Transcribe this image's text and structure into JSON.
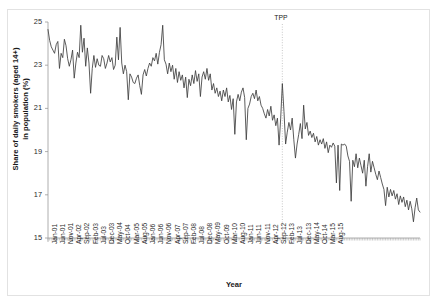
{
  "figure": {
    "caption_remnant": "",
    "x_axis_title": "Year",
    "y_axis_title_line1": "Share of daily smokers (aged 14+)",
    "y_axis_title_line2": "in population (%)",
    "annotation_label": "TPP",
    "line_color": "#3f3f3f",
    "axis_color": "#9a9a9a",
    "annotation_color": "#b0b0b0",
    "frame_color": "#e2e2e2"
  },
  "chart_data": {
    "type": "line",
    "title": "",
    "subtitle": "",
    "xlabel": "Year",
    "ylabel": "Share of daily smokers (aged 14+) in population (%)",
    "ylim": [
      15,
      25
    ],
    "yticks": [
      15,
      17,
      19,
      21,
      23,
      25
    ],
    "grid": false,
    "legend": false,
    "x_tick_labels": [
      "Jan-01",
      "Jun-01",
      "Nov-01",
      "Apr-02",
      "Sep-02",
      "Feb-03",
      "Jul-03",
      "Dec-03",
      "May-04",
      "Oct-04",
      "Mar-05",
      "Aug-05",
      "Jan-06",
      "Jun-06",
      "Nov-06",
      "Apr-07",
      "Sep-07",
      "Feb-08",
      "Jul-08",
      "Dec-08",
      "May-09",
      "Oct-09",
      "Mar-10",
      "Aug-10",
      "Jan-11",
      "Jun-11",
      "Nov-11",
      "Apr-12",
      "Sep-12",
      "Feb-13",
      "Jul-13",
      "Dec-13",
      "May-14",
      "Oct-14",
      "Mar-15",
      "Aug-15"
    ],
    "x_tick_interval_months": 5,
    "x_start": "Jan-01",
    "x_end": "Aug-15",
    "annotations": [
      {
        "label": "TPP",
        "x_index": 143,
        "x_label": "Dec-12",
        "style": "dotted-vertical-line"
      }
    ],
    "series": [
      {
        "name": "Share of daily smokers (aged 14+) in population (%)",
        "values": [
          24.65,
          24.15,
          23.85,
          23.7,
          23.55,
          23.95,
          24.1,
          22.85,
          23.55,
          23.35,
          24.2,
          23.9,
          23.3,
          22.95,
          23.25,
          23.7,
          22.4,
          23.1,
          23.6,
          23.35,
          24.85,
          23.6,
          24.25,
          22.95,
          23.8,
          23.1,
          21.7,
          22.85,
          23.45,
          22.9,
          23.3,
          23.0,
          22.95,
          23.45,
          23.3,
          22.85,
          23.1,
          23.45,
          23.15,
          23.35,
          22.8,
          23.0,
          24.3,
          23.25,
          24.75,
          23.1,
          22.6,
          23.0,
          22.7,
          21.4,
          22.6,
          22.45,
          22.2,
          22.15,
          22.4,
          22.55,
          22.05,
          21.65,
          22.55,
          22.8,
          22.5,
          22.85,
          23.1,
          22.95,
          23.35,
          23.2,
          23.55,
          23.05,
          23.6,
          23.95,
          24.85,
          23.25,
          23.05,
          22.6,
          23.1,
          22.7,
          23.0,
          22.35,
          22.85,
          22.2,
          22.7,
          22.3,
          22.55,
          21.95,
          22.45,
          21.5,
          22.35,
          22.05,
          22.55,
          22.15,
          22.75,
          22.25,
          22.6,
          21.55,
          22.45,
          22.7,
          22.35,
          22.85,
          22.3,
          22.6,
          21.85,
          22.15,
          21.7,
          21.95,
          21.55,
          21.8,
          21.35,
          21.85,
          21.55,
          21.95,
          21.3,
          21.6,
          20.95,
          21.45,
          19.8,
          21.3,
          21.65,
          21.35,
          21.75,
          21.95,
          21.5,
          19.55,
          21.0,
          21.2,
          21.55,
          21.7,
          21.45,
          21.85,
          21.35,
          21.55,
          21.15,
          21.0,
          20.75,
          20.55,
          20.95,
          20.65,
          21.1,
          20.45,
          20.7,
          20.2,
          20.55,
          19.3,
          20.55,
          22.15,
          20.85,
          19.35,
          19.9,
          20.35,
          20.0,
          20.55,
          19.55,
          18.7,
          19.35,
          19.8,
          20.3,
          19.6,
          21.15,
          20.05,
          20.35,
          19.75,
          19.95,
          19.65,
          19.85,
          19.45,
          19.7,
          19.3,
          19.55,
          19.35,
          19.6,
          19.15,
          19.45,
          18.95,
          19.3,
          19.2,
          19.4,
          19.25,
          17.55,
          19.3,
          17.2,
          19.35,
          19.3,
          19.35,
          19.25,
          18.8,
          18.55,
          16.7,
          18.6,
          18.3,
          18.9,
          18.25,
          18.7,
          18.35,
          18.0,
          18.6,
          17.4,
          18.3,
          18.9,
          18.05,
          18.55,
          18.25,
          17.95,
          17.7,
          18.1,
          17.8,
          17.5,
          17.25,
          16.5,
          17.35,
          16.9,
          17.25,
          16.95,
          17.2,
          16.8,
          17.05,
          16.55,
          16.95,
          16.65,
          16.9,
          16.45,
          16.75,
          16.3,
          16.7,
          16.35,
          15.75,
          16.4,
          16.85,
          16.3,
          16.2
        ]
      }
    ]
  }
}
